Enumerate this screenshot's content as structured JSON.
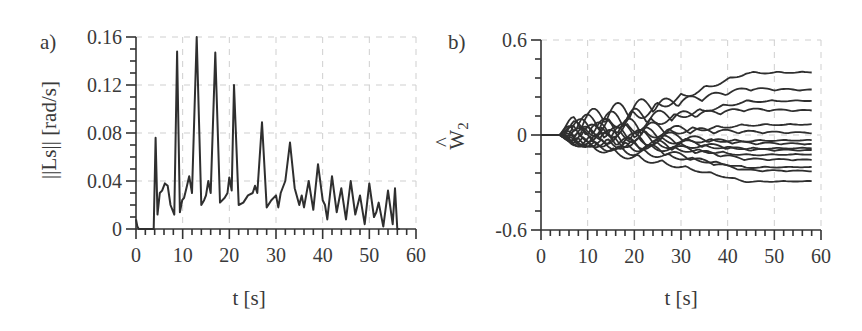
{
  "chart_data": [
    {
      "panel": "a)",
      "type": "line",
      "title": "",
      "xlabel": "t [s]",
      "ylabel": "||Ls|| [rad/s]",
      "xlim": [
        0,
        60
      ],
      "ylim": [
        0,
        0.16
      ],
      "xticks": [
        "0",
        "10",
        "20",
        "30",
        "40",
        "50",
        "60"
      ],
      "yticks": [
        "0",
        "0.04",
        "0.08",
        "0.12",
        "0.16"
      ],
      "grid": "dashed light gray",
      "legend": "none",
      "series": [
        {
          "name": "||Ls||",
          "x": [
            0,
            0.3,
            0.6,
            3.8,
            4.2,
            4.6,
            5.1,
            5.6,
            6.2,
            6.8,
            7.4,
            8.2,
            8.8,
            9.4,
            9.9,
            10.3,
            10.8,
            11.4,
            12,
            13,
            14,
            14.6,
            15,
            15.5,
            16,
            17,
            18,
            19,
            19.6,
            20,
            20.5,
            21,
            22,
            23,
            24,
            25,
            25.5,
            26,
            27,
            28,
            29,
            30,
            30.5,
            31,
            32,
            33,
            34,
            35,
            35.5,
            36,
            37,
            38,
            39,
            40,
            40.5,
            41,
            42,
            43,
            44,
            45,
            46,
            47,
            48,
            49,
            50,
            51,
            51.5,
            52,
            53,
            54,
            55,
            55.5,
            56,
            56.5
          ],
          "y": [
            0.008,
            0.002,
            0,
            0,
            0.076,
            0.012,
            0.03,
            0.032,
            0.038,
            0.036,
            0.02,
            0.012,
            0.148,
            0.014,
            0.024,
            0.026,
            0.034,
            0.044,
            0.03,
            0.16,
            0.02,
            0.024,
            0.028,
            0.04,
            0.03,
            0.147,
            0.022,
            0.026,
            0.03,
            0.043,
            0.032,
            0.12,
            0.02,
            0.022,
            0.028,
            0.03,
            0.036,
            0.03,
            0.089,
            0.018,
            0.024,
            0.028,
            0.018,
            0.03,
            0.04,
            0.072,
            0.034,
            0.02,
            0.028,
            0.018,
            0.04,
            0.016,
            0.054,
            0.024,
            0.02,
            0.008,
            0.044,
            0.014,
            0.034,
            0.008,
            0.04,
            0.012,
            0.028,
            0.004,
            0.038,
            0.01,
            0.014,
            0.022,
            0.002,
            0.032,
            0.004,
            0.034,
            0,
            0
          ]
        }
      ]
    },
    {
      "panel": "b)",
      "type": "line",
      "title": "",
      "xlabel": "t [s]",
      "ylabel": "Ŵ2",
      "xlim": [
        0,
        60
      ],
      "ylim": [
        -0.6,
        0.6
      ],
      "xticks": [
        "0",
        "10",
        "20",
        "30",
        "40",
        "50",
        "60"
      ],
      "yticks": [
        "-0.6",
        "0",
        "0.6"
      ],
      "grid": "dashed light gray",
      "legend": "none",
      "description": "Many weight trajectories starting at 0, oscillating from ~5 s, then diverging and settling to constant values by ~50-60 s",
      "final_values": [
        0.4,
        0.28,
        0.22,
        0.15,
        0.07,
        0.01,
        -0.03,
        -0.06,
        -0.08,
        -0.1,
        -0.12,
        -0.16,
        -0.2,
        -0.23,
        -0.29
      ]
    }
  ]
}
